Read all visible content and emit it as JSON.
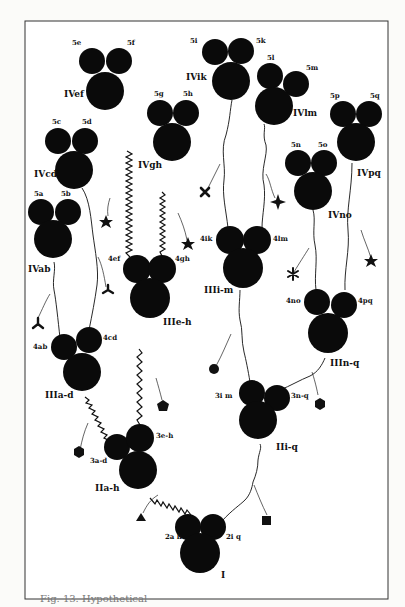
{
  "figure": {
    "caption": "Fig. 13. Hypothetical",
    "root": {
      "id": "I",
      "label": "I",
      "left_label": "2a h",
      "right_label": "2i q"
    },
    "level2": [
      {
        "id": "IIa-h",
        "label": "IIa-h",
        "left_label": "3a-d",
        "right_label": "3e-h"
      },
      {
        "id": "IIi-q",
        "label": "IIi-q",
        "left_label": "3i m",
        "right_label": "3n-q"
      }
    ],
    "level3": [
      {
        "id": "IIIa-d",
        "label": "IIIa-d",
        "left_label": "4ab",
        "right_label": "4cd"
      },
      {
        "id": "IIIe-h",
        "label": "IIIe-h",
        "left_label": "4ef",
        "right_label": "4gh"
      },
      {
        "id": "IIIi-m",
        "label": "IIIi-m",
        "left_label": "4ik",
        "right_label": "4lm"
      },
      {
        "id": "IIIn-q",
        "label": "IIIn-q",
        "left_label": "4no",
        "right_label": "4pq"
      }
    ],
    "level4": [
      {
        "id": "IVab",
        "label": "IVab",
        "left_label": "5a",
        "right_label": "5b"
      },
      {
        "id": "IVcd",
        "label": "IVcd",
        "left_label": "5c",
        "right_label": "5d"
      },
      {
        "id": "IVef",
        "label": "IVef",
        "left_label": "5e",
        "right_label": "5f"
      },
      {
        "id": "IVgh",
        "label": "IVgh",
        "left_label": "5g",
        "right_label": "5h"
      },
      {
        "id": "IVik",
        "label": "IVik",
        "left_label": "5i",
        "right_label": "5k"
      },
      {
        "id": "IVlm",
        "label": "IVlm",
        "left_label": "5l",
        "right_label": "5m"
      },
      {
        "id": "IVno",
        "label": "IVno",
        "left_label": "5n",
        "right_label": "5o"
      },
      {
        "id": "IVpq",
        "label": "IVpq",
        "left_label": "5p",
        "right_label": "5q"
      }
    ],
    "symbols": [
      {
        "name": "triangle-icon",
        "near": "2a h"
      },
      {
        "name": "square-icon",
        "near": "2i q"
      },
      {
        "name": "hexagon-icon",
        "near": "3a-d"
      },
      {
        "name": "pentagon-icon",
        "near": "3e-h"
      },
      {
        "name": "circle-icon",
        "near": "3i m"
      },
      {
        "name": "hexagon-icon",
        "near": "3n-q"
      },
      {
        "name": "tripod-icon",
        "near": "4ab"
      },
      {
        "name": "tripod-icon",
        "near": "4cd"
      },
      {
        "name": "star-icon",
        "near": "4ef"
      },
      {
        "name": "star-icon",
        "near": "4gh"
      },
      {
        "name": "cross-icon",
        "near": "4ik"
      },
      {
        "name": "four-point-star-icon",
        "near": "4lm"
      },
      {
        "name": "asterisk-icon",
        "near": "4no"
      },
      {
        "name": "star-icon",
        "near": "4pq"
      }
    ]
  }
}
